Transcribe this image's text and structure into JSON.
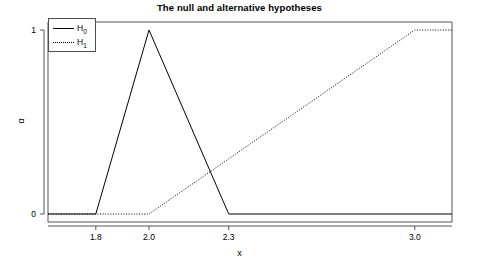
{
  "chart_data": {
    "type": "line",
    "title": "The null and alternative hypotheses",
    "xlabel": "x",
    "ylabel": "α",
    "xlim": [
      1.62,
      3.14
    ],
    "ylim": [
      0,
      1
    ],
    "grid": false,
    "legend_position": "top-left",
    "xticks": [
      {
        "value": 1.8,
        "label": "1.8"
      },
      {
        "value": 2.0,
        "label": "2.0"
      },
      {
        "value": 2.3,
        "label": "2.3"
      },
      {
        "value": 3.0,
        "label": "3.0"
      }
    ],
    "yticks": [
      {
        "value": 0,
        "label": "0"
      },
      {
        "value": 1,
        "label": "1"
      }
    ],
    "series": [
      {
        "name": "H0",
        "label": "H",
        "subscript": "0",
        "linestyle": "solid",
        "color": "#000000",
        "points": [
          {
            "x": 1.62,
            "y": 0
          },
          {
            "x": 1.8,
            "y": 0
          },
          {
            "x": 2.0,
            "y": 1
          },
          {
            "x": 2.3,
            "y": 0
          },
          {
            "x": 3.14,
            "y": 0
          }
        ]
      },
      {
        "name": "H1",
        "label": "H",
        "subscript": "1",
        "linestyle": "dotted",
        "color": "#000000",
        "points": [
          {
            "x": 1.62,
            "y": 0
          },
          {
            "x": 1.8,
            "y": 0
          },
          {
            "x": 2.0,
            "y": 0
          },
          {
            "x": 3.0,
            "y": 1
          },
          {
            "x": 3.14,
            "y": 1
          }
        ]
      }
    ]
  },
  "legend": {
    "items": [
      {
        "name": "H0",
        "base": "H",
        "sub": "0"
      },
      {
        "name": "H1",
        "base": "H",
        "sub": "1"
      }
    ]
  }
}
